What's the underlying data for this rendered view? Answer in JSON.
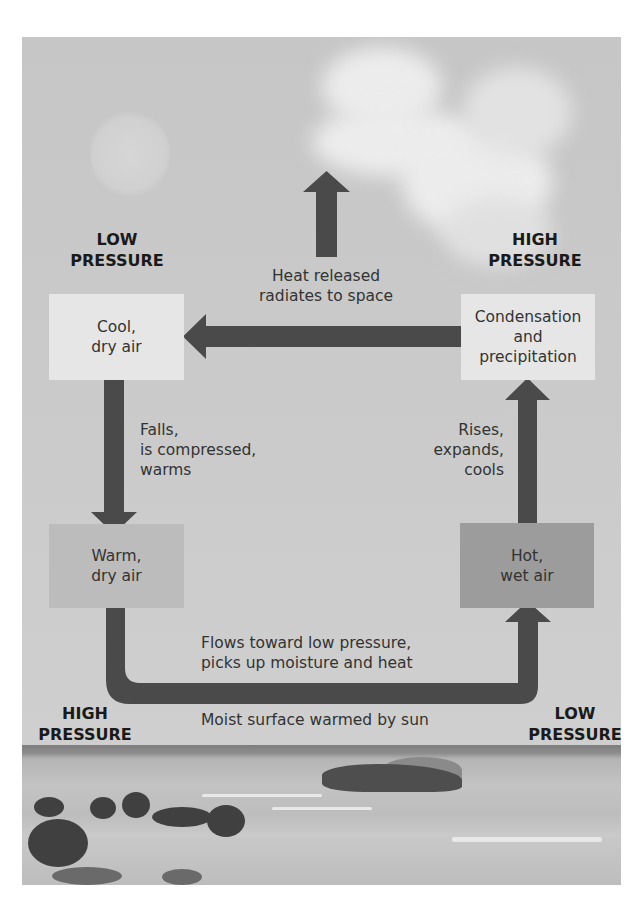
{
  "diagram": {
    "title": "",
    "pressure_labels": {
      "top_left": {
        "line1": "LOW",
        "line2": "PRESSURE"
      },
      "top_right": {
        "line1": "HIGH",
        "line2": "PRESSURE"
      },
      "bottom_left": {
        "line1": "HIGH",
        "line2": "PRESSURE"
      },
      "bottom_right": {
        "line1": "LOW",
        "line2": "PRESSURE"
      }
    },
    "boxes": {
      "cool_dry": {
        "line1": "Cool,",
        "line2": "dry air"
      },
      "condensation": {
        "line1": "Condensation",
        "line2": "and",
        "line3": "precipitation"
      },
      "warm_dry": {
        "line1": "Warm,",
        "line2": "dry air"
      },
      "hot_wet": {
        "line1": "Hot,",
        "line2": "wet air"
      }
    },
    "arrow_labels": {
      "heat_released": {
        "line1": "Heat released",
        "line2": "radiates to space"
      },
      "falls": {
        "line1": "Falls,",
        "line2": "is compressed,",
        "line3": "warms"
      },
      "rises": {
        "line1": "Rises,",
        "line2": "expands,",
        "line3": "cools"
      },
      "flows": {
        "line1": "Flows toward low pressure,",
        "line2": "picks up moisture and heat"
      },
      "moist_surface": "Moist surface warmed by sun"
    },
    "colors": {
      "arrow": "#4a4a4a",
      "background_sky": "#c9c9c9",
      "box_light": "#e6e6e6",
      "box_mid": "#bcbcbc",
      "box_dark": "#9c9c9c"
    }
  }
}
